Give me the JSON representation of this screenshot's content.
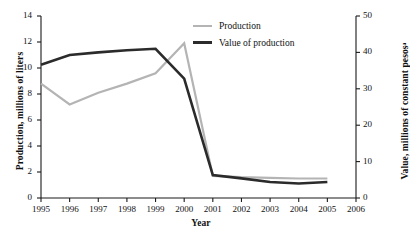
{
  "chart_data": {
    "type": "line",
    "title": "",
    "xlabel": "Year",
    "ylabel": "Production, millions of liters",
    "y2label": "Value, millions of constant pesosᵃ",
    "x": [
      1995,
      1996,
      1997,
      1998,
      1999,
      2000,
      2001,
      2002,
      2003,
      2004,
      2005
    ],
    "categories": [
      "1995",
      "1996",
      "1997",
      "1998",
      "1999",
      "2000",
      "2001",
      "2002",
      "2003",
      "2004",
      "2005"
    ],
    "xlim": [
      1995,
      2006
    ],
    "xticks": [
      "1995",
      "1996",
      "1997",
      "1998",
      "1999",
      "2000",
      "2001",
      "2002",
      "2003",
      "2004",
      "2005",
      "2006"
    ],
    "ylim": [
      0,
      14
    ],
    "yticks": [
      "0",
      "2",
      "4",
      "6",
      "8",
      "10",
      "12",
      "14"
    ],
    "y2lim": [
      0,
      50
    ],
    "y2ticks": [
      "0",
      "10",
      "20",
      "30",
      "40",
      "50"
    ],
    "grid": false,
    "legend_position": "top-center",
    "series": [
      {
        "name": "Production",
        "axis": "left",
        "color": "#b4b4b4",
        "values": [
          8.8,
          7.2,
          8.1,
          8.8,
          9.6,
          11.9,
          1.7,
          1.6,
          1.55,
          1.5,
          1.5
        ]
      },
      {
        "name": "Value of production",
        "axis": "right",
        "color": "#2b2b2b",
        "values": [
          36.6,
          39.3,
          40.0,
          40.6,
          41.0,
          32.8,
          6.3,
          5.4,
          4.4,
          4.0,
          4.4
        ]
      }
    ]
  },
  "legend": {
    "items": [
      {
        "label": "Production",
        "key": "production"
      },
      {
        "label": "Value of production",
        "key": "value"
      }
    ]
  },
  "axes": {
    "x_title": "Year",
    "y_left_title": "Production, millions of liters",
    "y_right_title": "Value, millions of constant pesosᵃ"
  }
}
